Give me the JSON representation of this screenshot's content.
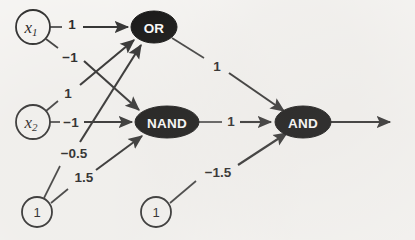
{
  "figure": {
    "background_color": "#f8f7f5",
    "ink_color": "#1e1e1e",
    "gate_fill_color": "#0d0d0d",
    "gate_text_color": "#ffffff"
  },
  "nodes": {
    "x1": {
      "id": "x1",
      "label": "x",
      "subscript": "1",
      "kind": "input",
      "shape": "circle",
      "cx": 33,
      "cy": 27,
      "r": 17
    },
    "x2": {
      "id": "x2",
      "label": "x",
      "subscript": "2",
      "kind": "input",
      "shape": "circle",
      "cx": 33,
      "cy": 122,
      "r": 17
    },
    "bias1": {
      "id": "bias1",
      "label": "1",
      "kind": "bias",
      "shape": "circle",
      "cx": 37,
      "cy": 212,
      "r": 15
    },
    "bias2": {
      "id": "bias2",
      "label": "1",
      "kind": "bias",
      "shape": "circle",
      "cx": 156,
      "cy": 212,
      "r": 15
    },
    "or": {
      "id": "or",
      "label": "OR",
      "kind": "gate",
      "shape": "ellipse",
      "cx": 154,
      "cy": 27,
      "rx": 23,
      "ry": 16
    },
    "nand": {
      "id": "nand",
      "label": "NAND",
      "kind": "gate",
      "shape": "ellipse",
      "cx": 167,
      "cy": 122,
      "rx": 32,
      "ry": 16
    },
    "and": {
      "id": "and",
      "label": "AND",
      "kind": "gate",
      "shape": "ellipse",
      "cx": 303,
      "cy": 122,
      "rx": 28,
      "ry": 16
    }
  },
  "edges": [
    {
      "id": "x1-or",
      "from": "x1",
      "to": "or",
      "weight": "1",
      "label_x": 72,
      "label_y": 23
    },
    {
      "id": "x1-nand",
      "from": "x1",
      "to": "nand",
      "weight": "−1",
      "label_x": 70,
      "label_y": 56
    },
    {
      "id": "x2-or",
      "from": "x2",
      "to": "or",
      "weight": "1",
      "label_x": 68,
      "label_y": 92
    },
    {
      "id": "x2-nand",
      "from": "x2",
      "to": "nand",
      "weight": "−1",
      "label_x": 71,
      "label_y": 122
    },
    {
      "id": "bias1-or",
      "from": "bias1",
      "to": "or",
      "weight": "−0.5",
      "label_x": 74,
      "label_y": 152
    },
    {
      "id": "bias1-nand",
      "from": "bias1",
      "to": "nand",
      "weight": "1.5",
      "label_x": 84,
      "label_y": 176
    },
    {
      "id": "or-and",
      "from": "or",
      "to": "and",
      "weight": "1",
      "label_x": 217,
      "label_y": 66
    },
    {
      "id": "nand-and",
      "from": "nand",
      "to": "and",
      "weight": "1",
      "label_x": 231,
      "label_y": 121
    },
    {
      "id": "bias2-and",
      "from": "bias2",
      "to": "and",
      "weight": "−1.5",
      "label_x": 218,
      "label_y": 172
    }
  ],
  "output": {
    "label": "",
    "from": "and",
    "arrow_end_x": 397,
    "arrow_y": 122
  }
}
